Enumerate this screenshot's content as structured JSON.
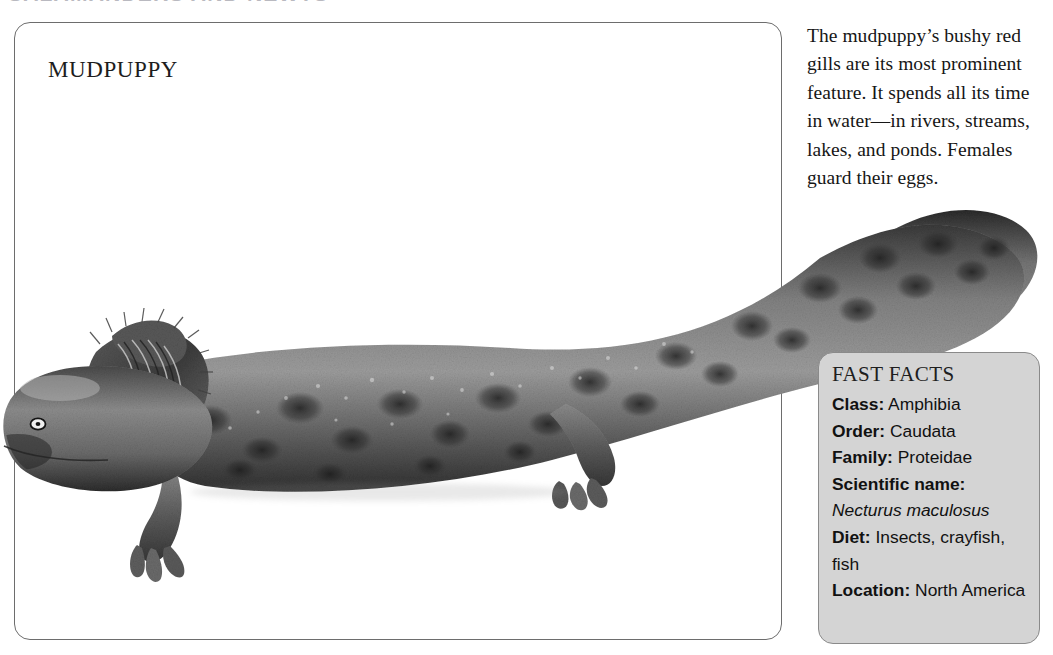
{
  "page": {
    "running_header": "SALAMANDERS AND NEWTS",
    "background_color": "#ffffff"
  },
  "card": {
    "title": "MUDPUPPY",
    "border_color": "#6d6d6d"
  },
  "description": {
    "text": "The mudpuppy’s bushy red gills are its most prominent feature. It spends all its time in water—in rivers, streams, lakes, and ponds. Females guard their eggs."
  },
  "fast_facts": {
    "title": "FAST FACTS",
    "panel_color": "#d4d4d4",
    "rows": [
      {
        "label": "Class:",
        "value": "Amphibia",
        "italic": false
      },
      {
        "label": "Order:",
        "value": "Caudata",
        "italic": false
      },
      {
        "label": "Family:",
        "value": "Proteidae",
        "italic": false
      },
      {
        "label": "Scientific name:",
        "value": "",
        "italic": false
      },
      {
        "label": "",
        "value": "Necturus maculosus",
        "italic": true
      },
      {
        "label": "Diet:",
        "value": "Insects, crayfish, fish",
        "italic": false
      },
      {
        "label": "Location:",
        "value": "North America",
        "italic": false
      }
    ]
  },
  "illustration": {
    "name": "mudpuppy-salamander-illustration",
    "description": "Grayscale engraving-style illustration of a mudpuppy salamander with bushy external gills, mottled dark spots, four limbs and a long flattened tail",
    "body_color": "#6b6b6b",
    "spot_color": "#2b2b2b"
  }
}
